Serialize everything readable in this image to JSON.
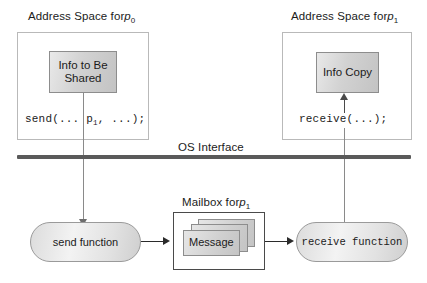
{
  "diagram": {
    "title_left": "Address Space for",
    "title_left_proc": "p",
    "title_left_sub": "0",
    "title_right": "Address Space for",
    "title_right_proc": "p",
    "title_right_sub": "1",
    "os_interface_label": "OS Interface",
    "info_shared_line1": "Info to Be",
    "info_shared_line2": "Shared",
    "info_copy_label": "Info Copy",
    "send_call": "send(... p",
    "send_call_sub": "1",
    "send_call_tail": ", ...);",
    "receive_call": "receive(...);",
    "send_function_label": "send function",
    "receive_function_label": "receive function",
    "mailbox_title": "Mailbox for",
    "mailbox_proc": "p",
    "mailbox_sub": "1",
    "message_label": "Message"
  },
  "colors": {
    "rule": "#5a5a5a",
    "box_border": "#8d8d8d",
    "frame_border": "#b9b9b9",
    "mailbox_border": "#4a4a4a",
    "connector": "#8a8a8a",
    "text": "#1b1b1b"
  }
}
